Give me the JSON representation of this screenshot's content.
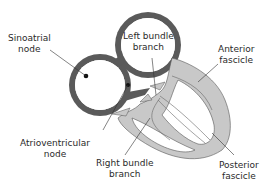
{
  "diagram": {
    "labels": {
      "sinoatrial": {
        "line1": "Sinoatrial",
        "line2": "node"
      },
      "left_bundle": {
        "line1": "Left bundle",
        "line2": "branch"
      },
      "anterior": {
        "line1": "Anterior",
        "line2": "fascicle"
      },
      "atrioventricular": {
        "line1": "Atrioventricular",
        "line2": "node"
      },
      "right_bundle": {
        "line1": "Right bundle",
        "line2": "branch"
      },
      "posterior": {
        "line1": "Posterior",
        "line2": "fascicle"
      }
    },
    "colors": {
      "atria": "#5a5a5a",
      "ventricles": "#c8c8c8",
      "outline": "#3a3a3a",
      "leader": "#333333",
      "text": "#2a2a2a",
      "background": "#ffffff"
    }
  }
}
